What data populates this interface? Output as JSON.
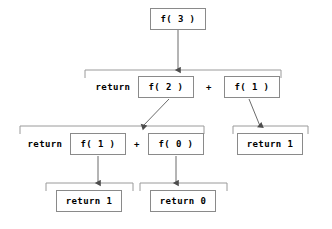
{
  "diagram": {
    "colors": {
      "box_border": "#8a8a8a",
      "bracket": "#9a9a9a",
      "connector": "#6b6b6b",
      "text": "#000000",
      "background": "#ffffff"
    },
    "nodes": [
      {
        "id": "n-f3",
        "label": "f( 3 )",
        "x": 150,
        "y": 8,
        "w": 56,
        "h": 22
      },
      {
        "id": "n-f2",
        "label": "f( 2 )",
        "x": 138,
        "y": 76,
        "w": 56,
        "h": 22
      },
      {
        "id": "n-f1-right",
        "label": "f( 1 )",
        "x": 224,
        "y": 76,
        "w": 56,
        "h": 22
      },
      {
        "id": "n-f1-left",
        "label": "f( 1 )",
        "x": 70,
        "y": 133,
        "w": 56,
        "h": 22
      },
      {
        "id": "n-f0",
        "label": "f( 0 )",
        "x": 148,
        "y": 133,
        "w": 56,
        "h": 22
      },
      {
        "id": "n-return1-r",
        "label": "return 1",
        "x": 237,
        "y": 133,
        "w": 66,
        "h": 22
      },
      {
        "id": "n-return1-b",
        "label": "return 1",
        "x": 56,
        "y": 190,
        "w": 66,
        "h": 22
      },
      {
        "id": "n-return0-b",
        "label": "return 0",
        "x": 150,
        "y": 190,
        "w": 66,
        "h": 22
      }
    ],
    "operators": [
      {
        "id": "op-return-row2",
        "label": "return",
        "x": 89,
        "y": 76,
        "w": 48,
        "h": 22
      },
      {
        "id": "op-plus-row2",
        "label": "+",
        "x": 196,
        "y": 76,
        "w": 26,
        "h": 22
      },
      {
        "id": "op-return-row3",
        "label": "return",
        "x": 21,
        "y": 133,
        "w": 48,
        "h": 22
      },
      {
        "id": "op-plus-row3",
        "label": "+",
        "x": 127,
        "y": 133,
        "w": 20,
        "h": 22
      }
    ],
    "brackets": [
      {
        "id": "bracket-row2",
        "x1": 85,
        "x2": 281,
        "y": 70,
        "drop": 8
      },
      {
        "id": "bracket-row3-left",
        "x1": 20,
        "x2": 204,
        "y": 126,
        "drop": 8
      },
      {
        "id": "bracket-row3-right",
        "x1": 233,
        "x2": 308,
        "y": 126,
        "drop": 8
      },
      {
        "id": "bracket-row4-left",
        "x1": 46,
        "x2": 133,
        "y": 183,
        "drop": 8
      },
      {
        "id": "bracket-row4-right",
        "x1": 140,
        "x2": 227,
        "y": 183,
        "drop": 8
      }
    ],
    "connectors": [
      {
        "id": "edge-f3-to-row2",
        "from": "n-f3",
        "to": "bracket-row2",
        "x1": 178,
        "y1": 30,
        "x2": 178,
        "y2": 70,
        "kind": "straight"
      },
      {
        "id": "edge-f2-to-row3left",
        "from": "n-f2",
        "to": "bracket-row3-left",
        "x1": 169,
        "y1": 99,
        "x2": 143,
        "y2": 126,
        "kind": "diagonal"
      },
      {
        "id": "edge-f1r-to-row3right",
        "from": "n-f1-right",
        "to": "bracket-row3-right",
        "x1": 249,
        "y1": 99,
        "x2": 260,
        "y2": 126,
        "kind": "diagonal"
      },
      {
        "id": "edge-f1l-to-row4left",
        "from": "n-f1-left",
        "to": "bracket-row4-left",
        "x1": 98,
        "y1": 156,
        "x2": 98,
        "y2": 183,
        "kind": "straight"
      },
      {
        "id": "edge-f0-to-row4right",
        "from": "n-f0",
        "to": "bracket-row4-right",
        "x1": 176,
        "y1": 156,
        "x2": 176,
        "y2": 183,
        "kind": "straight"
      }
    ]
  },
  "chart_data": {
    "type": "diagram",
    "nodes": [
      "f( 3 )",
      "f( 2 )",
      "f( 1 )",
      "f( 1 )",
      "f( 0 )",
      "return 1",
      "return 1",
      "return 0"
    ],
    "edges": [
      [
        "f( 3 )",
        "return f( 2 ) + f( 1 )"
      ],
      [
        "f( 2 )",
        "return f( 1 ) + f( 0 )"
      ],
      [
        "f( 1 )",
        "return 1"
      ],
      [
        "f( 1 )",
        "return 1"
      ],
      [
        "f( 0 )",
        "return 0"
      ]
    ],
    "expressions": [
      "f( 3 )",
      "return f( 2 ) + f( 1 )",
      "return f( 1 ) + f( 0 )",
      "return 1",
      "return 1",
      "return 0"
    ]
  }
}
